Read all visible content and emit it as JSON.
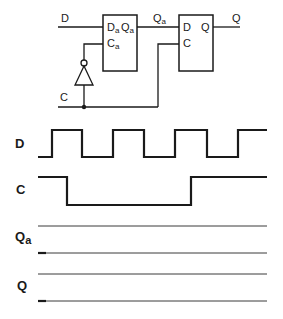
{
  "circuit": {
    "input_d_label": "D",
    "input_c_label": "C",
    "intermediate_label": "Qa",
    "intermediate_main": "Q",
    "intermediate_sub": "a",
    "output_label": "Q",
    "latch1": {
      "d_pin_main": "D",
      "d_pin_sub": "a",
      "q_pin_main": "Q",
      "q_pin_sub": "a",
      "c_pin_main": "C",
      "c_pin_sub": "a"
    },
    "latch2": {
      "d_pin": "D",
      "q_pin": "Q",
      "c_pin": "C"
    },
    "inverter": "NOT gate on clock into latch 1"
  },
  "timing": {
    "signals": [
      {
        "label": "D",
        "main": "D",
        "sub": "",
        "waveform": "square, starts low, toggles",
        "transitions_x": [
          52,
          82,
          113,
          144,
          175,
          207,
          238
        ]
      },
      {
        "label": "C",
        "main": "C",
        "sub": "",
        "waveform": "high, low, high",
        "transitions_x": [
          67,
          191
        ]
      },
      {
        "label": "Qa",
        "main": "Q",
        "sub": "a",
        "waveform": "blank (to be filled)",
        "transitions_x": []
      },
      {
        "label": "Q",
        "main": "Q",
        "sub": "",
        "waveform": "blank (to be filled)",
        "transitions_x": []
      }
    ]
  }
}
